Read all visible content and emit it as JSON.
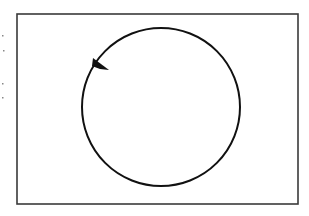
{
  "diagram": {
    "frame": {
      "x": 17,
      "y": 14,
      "width": 281,
      "height": 190,
      "stroke": "#3a3a3a"
    },
    "circle": {
      "cx": 161,
      "cy": 107,
      "rx": 79,
      "ry": 79,
      "stroke": "#111111"
    },
    "marker": {
      "points": "93,58 109,70 100,69 92,66",
      "fill": "#111111"
    },
    "edge_marks": [
      {
        "x": 2,
        "y": 35
      },
      {
        "x": 3,
        "y": 50
      },
      {
        "x": 2,
        "y": 83
      },
      {
        "x": 2,
        "y": 97
      }
    ]
  }
}
